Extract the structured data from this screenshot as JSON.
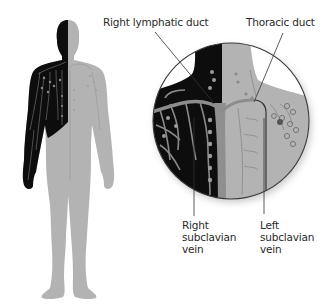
{
  "diagram": {
    "type": "anatomical-illustration",
    "colors": {
      "background": "#ffffff",
      "right_duct_region": "#0d0d0d",
      "thoracic_duct_region": "#b3b3b3",
      "vessel_light": "#9a9a9a",
      "leader_line": "#333333",
      "text": "#2a2a2a"
    },
    "labels": {
      "right_lymphatic_duct": "Right lymphatic duct",
      "thoracic_duct": "Thoracic duct",
      "right_subclavian_vein": [
        "Right",
        "subclavian",
        "vein"
      ],
      "left_subclavian_vein": [
        "Left",
        "subclavian",
        "vein"
      ]
    },
    "panels": {
      "full_body": "full-body-figure",
      "magnified": "magnified-neck-chest-inset"
    }
  }
}
